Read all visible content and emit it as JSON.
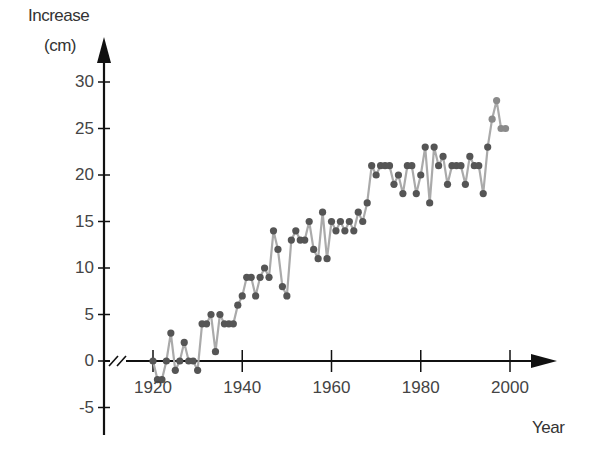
{
  "chart_data": {
    "type": "line",
    "title": "",
    "xlabel": "Year",
    "ylabel": "Increase (cm)",
    "ylabel_lines": [
      "Increase",
      "(cm)"
    ],
    "xlim": [
      1910,
      2010
    ],
    "ylim": [
      -7,
      33
    ],
    "x_ticks": [
      1920,
      1940,
      1960,
      1980,
      2000
    ],
    "x_tick_labels": [
      "1920",
      "1940",
      "1960",
      "1980",
      "2000"
    ],
    "y_ticks": [
      30,
      25,
      20,
      15,
      10,
      5,
      0,
      -5
    ],
    "y_tick_labels": [
      "30",
      "25",
      "20",
      "15",
      "10",
      "5",
      "0",
      "-5"
    ],
    "grid": false,
    "legend": null,
    "axis_break": "x-axis broken near origin",
    "marker_color": "#555555",
    "line_color": "#aaaaaa",
    "x": [
      1920,
      1921,
      1922,
      1923,
      1924,
      1925,
      1926,
      1927,
      1928,
      1929,
      1930,
      1931,
      1932,
      1933,
      1934,
      1935,
      1936,
      1937,
      1938,
      1939,
      1940,
      1941,
      1942,
      1943,
      1944,
      1945,
      1946,
      1947,
      1948,
      1949,
      1950,
      1951,
      1952,
      1953,
      1954,
      1955,
      1956,
      1957,
      1958,
      1959,
      1960,
      1961,
      1962,
      1963,
      1964,
      1965,
      1966,
      1967,
      1968,
      1969,
      1970,
      1971,
      1972,
      1973,
      1974,
      1975,
      1976,
      1977,
      1978,
      1979,
      1980,
      1981,
      1982,
      1983,
      1984,
      1985,
      1986,
      1987,
      1988,
      1989,
      1990,
      1991,
      1992,
      1993,
      1994,
      1995,
      1996,
      1997,
      1998,
      1999
    ],
    "values": [
      0,
      -2,
      -2,
      0,
      3,
      -1,
      0,
      2,
      0,
      0,
      -1,
      4,
      4,
      5,
      1,
      5,
      4,
      4,
      4,
      6,
      7,
      9,
      9,
      7,
      9,
      10,
      9,
      14,
      12,
      8,
      7,
      13,
      14,
      13,
      13,
      15,
      12,
      11,
      16,
      11,
      15,
      14,
      15,
      14,
      15,
      14,
      16,
      15,
      17,
      21,
      20,
      21,
      21,
      21,
      19,
      20,
      18,
      21,
      21,
      18,
      20,
      23,
      17,
      23,
      21,
      22,
      19,
      21,
      21,
      21,
      19,
      22,
      21,
      21,
      18,
      23,
      26,
      28,
      25,
      25
    ]
  }
}
